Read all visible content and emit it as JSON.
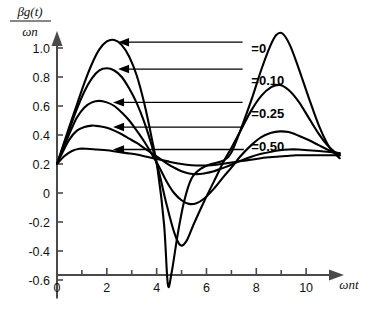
{
  "chart_data": {
    "type": "line",
    "title": "",
    "subtitle": "",
    "ylabel_numerator": "βg(t)",
    "ylabel_denominator": "ωn",
    "ylabel": "βg(t)/ωn",
    "xlabel": "ωnt",
    "xlim": [
      0,
      11.4
    ],
    "ylim": [
      -0.7,
      1.15
    ],
    "xticks": [
      0,
      2,
      4,
      6,
      8,
      10
    ],
    "xticklabels": [
      "0",
      "2",
      "4",
      "6",
      "8",
      "10"
    ],
    "xminorticks": [
      1,
      3,
      5,
      7,
      9,
      11
    ],
    "yticks": [
      -0.6,
      -0.4,
      -0.2,
      0,
      0.2,
      0.4,
      0.6,
      0.8,
      1.0
    ],
    "yticklabels": [
      "-0.6",
      "-0.4",
      "-0.2",
      "0",
      "0.2",
      "0.4",
      "0.6",
      "0.8",
      "1.0"
    ],
    "grid": false,
    "legend_position": "inline-annotations",
    "annotations": [
      {
        "label": "=0",
        "text_x": 7.8,
        "text_y": 1.0,
        "arrow_to_x": 2.45,
        "arrow_to_y": 1.04
      },
      {
        "label": "=0.10",
        "text_x": 7.8,
        "text_y": 0.78,
        "arrow_to_x": 2.45,
        "arrow_to_y": 0.855
      },
      {
        "label": "=0.25",
        "text_x": 7.8,
        "text_y": 0.555,
        "arrow_to_x": 2.25,
        "arrow_to_y": 0.625
      },
      {
        "label": "=0.50",
        "text_x": 7.8,
        "text_y": 0.325,
        "arrow_to_x": 2.25,
        "arrow_to_y": 0.455
      }
    ],
    "extra_leader": {
      "arrow_to_x": 2.25,
      "arrow_to_y": 0.3,
      "from_x": 7.5,
      "from_y": 0.3
    },
    "series": [
      {
        "name": "=0",
        "damping_ratio": 0,
        "points": [
          [
            0.0,
            0.2
          ],
          [
            0.25,
            0.33
          ],
          [
            0.5,
            0.46
          ],
          [
            0.8,
            0.61
          ],
          [
            1.1,
            0.76
          ],
          [
            1.4,
            0.89
          ],
          [
            1.7,
            0.99
          ],
          [
            2.0,
            1.045
          ],
          [
            2.3,
            1.055
          ],
          [
            2.6,
            1.02
          ],
          [
            2.9,
            0.94
          ],
          [
            3.2,
            0.81
          ],
          [
            3.5,
            0.62
          ],
          [
            3.8,
            0.38
          ],
          [
            4.05,
            0.15
          ],
          [
            4.3,
            -0.22
          ],
          [
            4.45,
            -0.63
          ],
          [
            4.6,
            -0.55
          ],
          [
            4.85,
            -0.28
          ],
          [
            5.1,
            -0.06
          ],
          [
            5.4,
            0.1
          ],
          [
            5.8,
            0.17
          ],
          [
            6.2,
            0.2
          ],
          [
            6.7,
            0.225
          ],
          [
            7.0,
            0.28
          ],
          [
            7.4,
            0.45
          ],
          [
            7.8,
            0.64
          ],
          [
            8.2,
            0.85
          ],
          [
            8.55,
            1.01
          ],
          [
            8.8,
            1.09
          ],
          [
            9.05,
            1.1
          ],
          [
            9.35,
            1.02
          ],
          [
            9.7,
            0.86
          ],
          [
            10.1,
            0.66
          ],
          [
            10.5,
            0.47
          ],
          [
            10.85,
            0.34
          ],
          [
            11.1,
            0.28
          ],
          [
            11.35,
            0.24
          ]
        ]
      },
      {
        "name": "=0.10",
        "damping_ratio": 0.1,
        "points": [
          [
            0.0,
            0.2
          ],
          [
            0.25,
            0.32
          ],
          [
            0.5,
            0.44
          ],
          [
            0.8,
            0.58
          ],
          [
            1.1,
            0.7
          ],
          [
            1.4,
            0.79
          ],
          [
            1.7,
            0.845
          ],
          [
            2.0,
            0.86
          ],
          [
            2.3,
            0.845
          ],
          [
            2.6,
            0.8
          ],
          [
            2.9,
            0.72
          ],
          [
            3.2,
            0.62
          ],
          [
            3.5,
            0.49
          ],
          [
            3.8,
            0.33
          ],
          [
            4.1,
            0.14
          ],
          [
            4.4,
            -0.08
          ],
          [
            4.7,
            -0.27
          ],
          [
            4.95,
            -0.36
          ],
          [
            5.2,
            -0.33
          ],
          [
            5.5,
            -0.21
          ],
          [
            5.9,
            -0.06
          ],
          [
            6.3,
            0.08
          ],
          [
            6.7,
            0.22
          ],
          [
            7.0,
            0.31
          ],
          [
            7.4,
            0.44
          ],
          [
            7.8,
            0.57
          ],
          [
            8.2,
            0.67
          ],
          [
            8.6,
            0.73
          ],
          [
            8.95,
            0.745
          ],
          [
            9.3,
            0.71
          ],
          [
            9.7,
            0.63
          ],
          [
            10.1,
            0.52
          ],
          [
            10.5,
            0.41
          ],
          [
            10.85,
            0.33
          ],
          [
            11.1,
            0.29
          ],
          [
            11.35,
            0.26
          ]
        ]
      },
      {
        "name": "=0.25",
        "damping_ratio": 0.25,
        "points": [
          [
            0.0,
            0.2
          ],
          [
            0.25,
            0.31
          ],
          [
            0.5,
            0.41
          ],
          [
            0.8,
            0.52
          ],
          [
            1.1,
            0.59
          ],
          [
            1.4,
            0.625
          ],
          [
            1.7,
            0.635
          ],
          [
            2.0,
            0.625
          ],
          [
            2.3,
            0.6
          ],
          [
            2.6,
            0.555
          ],
          [
            2.9,
            0.5
          ],
          [
            3.2,
            0.43
          ],
          [
            3.5,
            0.355
          ],
          [
            3.8,
            0.27
          ],
          [
            4.1,
            0.18
          ],
          [
            4.4,
            0.08
          ],
          [
            4.7,
            0.0
          ],
          [
            5.0,
            -0.05
          ],
          [
            5.3,
            -0.075
          ],
          [
            5.6,
            -0.07
          ],
          [
            5.9,
            -0.04
          ],
          [
            6.3,
            0.03
          ],
          [
            6.7,
            0.115
          ],
          [
            7.0,
            0.175
          ],
          [
            7.4,
            0.26
          ],
          [
            7.8,
            0.33
          ],
          [
            8.2,
            0.385
          ],
          [
            8.6,
            0.415
          ],
          [
            8.95,
            0.425
          ],
          [
            9.3,
            0.42
          ],
          [
            9.7,
            0.395
          ],
          [
            10.1,
            0.365
          ],
          [
            10.5,
            0.33
          ],
          [
            10.85,
            0.3
          ],
          [
            11.1,
            0.285
          ],
          [
            11.35,
            0.27
          ]
        ]
      },
      {
        "name": "=0.50",
        "damping_ratio": 0.5,
        "points": [
          [
            0.0,
            0.2
          ],
          [
            0.25,
            0.29
          ],
          [
            0.5,
            0.37
          ],
          [
            0.8,
            0.43
          ],
          [
            1.1,
            0.455
          ],
          [
            1.4,
            0.465
          ],
          [
            1.7,
            0.46
          ],
          [
            2.0,
            0.45
          ],
          [
            2.3,
            0.43
          ],
          [
            2.6,
            0.405
          ],
          [
            2.9,
            0.375
          ],
          [
            3.2,
            0.345
          ],
          [
            3.5,
            0.31
          ],
          [
            3.8,
            0.275
          ],
          [
            4.1,
            0.24
          ],
          [
            4.4,
            0.205
          ],
          [
            4.7,
            0.175
          ],
          [
            5.0,
            0.15
          ],
          [
            5.3,
            0.135
          ],
          [
            5.6,
            0.13
          ],
          [
            5.9,
            0.135
          ],
          [
            6.3,
            0.15
          ],
          [
            6.7,
            0.175
          ],
          [
            7.0,
            0.195
          ],
          [
            7.4,
            0.225
          ],
          [
            7.8,
            0.25
          ],
          [
            8.2,
            0.27
          ],
          [
            8.6,
            0.285
          ],
          [
            8.95,
            0.295
          ],
          [
            9.3,
            0.3
          ],
          [
            9.7,
            0.3
          ],
          [
            10.1,
            0.295
          ],
          [
            10.5,
            0.29
          ],
          [
            10.85,
            0.285
          ],
          [
            11.1,
            0.28
          ],
          [
            11.35,
            0.275
          ]
        ]
      },
      {
        "name": "lowest",
        "damping_ratio": null,
        "points": [
          [
            0.0,
            0.2
          ],
          [
            0.3,
            0.255
          ],
          [
            0.6,
            0.29
          ],
          [
            0.9,
            0.305
          ],
          [
            1.2,
            0.305
          ],
          [
            1.6,
            0.3
          ],
          [
            2.0,
            0.295
          ],
          [
            2.4,
            0.285
          ],
          [
            2.8,
            0.275
          ],
          [
            3.2,
            0.265
          ],
          [
            3.6,
            0.25
          ],
          [
            4.0,
            0.235
          ],
          [
            4.4,
            0.22
          ],
          [
            4.8,
            0.205
          ],
          [
            5.2,
            0.195
          ],
          [
            5.6,
            0.19
          ],
          [
            6.0,
            0.19
          ],
          [
            6.4,
            0.195
          ],
          [
            6.8,
            0.205
          ],
          [
            7.2,
            0.215
          ],
          [
            7.6,
            0.225
          ],
          [
            8.0,
            0.235
          ],
          [
            8.4,
            0.245
          ],
          [
            8.8,
            0.25
          ],
          [
            9.2,
            0.255
          ],
          [
            9.6,
            0.26
          ],
          [
            10.0,
            0.26
          ],
          [
            10.4,
            0.26
          ],
          [
            10.8,
            0.26
          ],
          [
            11.1,
            0.26
          ],
          [
            11.35,
            0.26
          ]
        ]
      }
    ]
  }
}
